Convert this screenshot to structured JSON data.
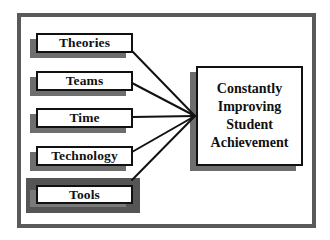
{
  "diagram": {
    "type": "fan-in",
    "inputs": [
      {
        "label": "Theories",
        "highlighted": false
      },
      {
        "label": "Teams",
        "highlighted": false
      },
      {
        "label": "Time",
        "highlighted": false
      },
      {
        "label": "Technology",
        "highlighted": false
      },
      {
        "label": "Tools",
        "highlighted": true
      }
    ],
    "goal": {
      "lines": [
        "Constantly",
        "Improving",
        "Student",
        "Achievement"
      ]
    },
    "colors": {
      "frame": "#5a5a5a",
      "shadow": "#6e6e6e",
      "highlight": "#555555",
      "line": "#111111",
      "box_fill": "#ffffff"
    }
  }
}
